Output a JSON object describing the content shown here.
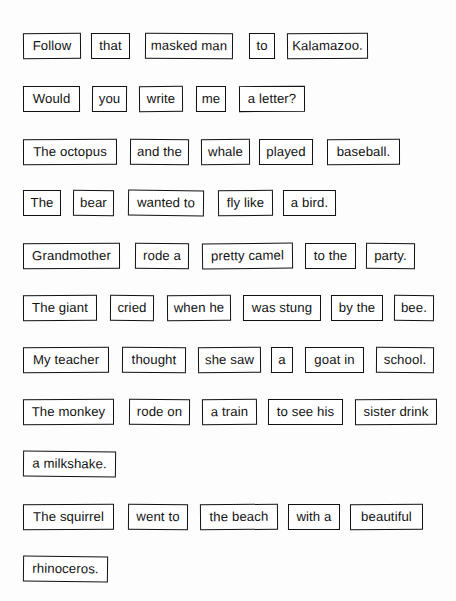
{
  "document": {
    "kind": "sentence-strip-worksheet",
    "page_background": "#fdfdfd",
    "ink_color": "#111111",
    "card_background": "#ffffff",
    "total_rows": 11,
    "total_cards": 49
  },
  "rows": [
    {
      "index": 1,
      "sentence": "Follow that masked man to Kalamazoo.",
      "top": 33,
      "cards": [
        {
          "text": "Follow",
          "left": 23,
          "width": 58,
          "skew": "sk-a"
        },
        {
          "text": "that",
          "left": 91,
          "width": 39,
          "skew": "sk-c"
        },
        {
          "text": "masked man",
          "left": 145,
          "width": 88,
          "skew": "sk-b"
        },
        {
          "text": "to",
          "left": 249,
          "width": 26,
          "skew": "sk-c"
        },
        {
          "text": "Kalamazoo.",
          "left": 287,
          "width": 81,
          "skew": "sk-a"
        }
      ]
    },
    {
      "index": 2,
      "sentence": "Would you write me a letter?",
      "top": 86,
      "cards": [
        {
          "text": "Would",
          "left": 23,
          "width": 57,
          "skew": "sk-c"
        },
        {
          "text": "you",
          "left": 92,
          "width": 35,
          "skew": "sk-b"
        },
        {
          "text": "write",
          "left": 139,
          "width": 44,
          "skew": "sk-a"
        },
        {
          "text": "me",
          "left": 196,
          "width": 30,
          "skew": "sk-f"
        },
        {
          "text": "a letter?",
          "left": 239,
          "width": 66,
          "skew": "sk-c"
        }
      ]
    },
    {
      "index": 3,
      "sentence": "The octopus and the whale played baseball.",
      "top": 139,
      "cards": [
        {
          "text": "The octopus",
          "left": 23,
          "width": 94,
          "skew": "sk-c"
        },
        {
          "text": "and the",
          "left": 130,
          "width": 59,
          "skew": "sk-b"
        },
        {
          "text": "whale",
          "left": 201,
          "width": 49,
          "skew": "sk-a"
        },
        {
          "text": "played",
          "left": 259,
          "width": 54,
          "skew": "sk-f"
        },
        {
          "text": "baseball.",
          "left": 327,
          "width": 73,
          "skew": "sk-c"
        }
      ]
    },
    {
      "index": 4,
      "sentence": "The bear wanted to fly like a bird.",
      "top": 190,
      "cards": [
        {
          "text": "The",
          "left": 23,
          "width": 38,
          "skew": "sk-c"
        },
        {
          "text": "bear",
          "left": 73,
          "width": 41,
          "skew": "sk-b"
        },
        {
          "text": "wanted to",
          "left": 128,
          "width": 76,
          "skew": "sk-d"
        },
        {
          "text": "fly like",
          "left": 218,
          "width": 55,
          "skew": "sk-a"
        },
        {
          "text": "a bird.",
          "left": 283,
          "width": 53,
          "skew": "sk-c"
        }
      ]
    },
    {
      "index": 5,
      "sentence": "Grandmother rode a pretty camel to the party.",
      "top": 243,
      "cards": [
        {
          "text": "Grandmother",
          "left": 23,
          "width": 97,
          "skew": "sk-c"
        },
        {
          "text": "rode a",
          "left": 135,
          "width": 54,
          "skew": "sk-b"
        },
        {
          "text": "pretty camel",
          "left": 202,
          "width": 91,
          "skew": "sk-e"
        },
        {
          "text": "to the",
          "left": 305,
          "width": 51,
          "skew": "sk-f"
        },
        {
          "text": "party.",
          "left": 366,
          "width": 49,
          "skew": "sk-b"
        }
      ]
    },
    {
      "index": 6,
      "sentence": "The giant cried when he was stung by the bee.",
      "top": 295,
      "cards": [
        {
          "text": "The giant",
          "left": 23,
          "width": 74,
          "skew": "sk-c"
        },
        {
          "text": "cried",
          "left": 110,
          "width": 44,
          "skew": "sk-b"
        },
        {
          "text": "when he",
          "left": 167,
          "width": 64,
          "skew": "sk-a"
        },
        {
          "text": "was stung",
          "left": 243,
          "width": 78,
          "skew": "sk-f"
        },
        {
          "text": "by the",
          "left": 331,
          "width": 52,
          "skew": "sk-c"
        },
        {
          "text": "bee.",
          "left": 394,
          "width": 40,
          "skew": "sk-b"
        }
      ]
    },
    {
      "index": 7,
      "sentence": "My teacher thought she saw a goat in school.",
      "top": 347,
      "cards": [
        {
          "text": "My teacher",
          "left": 23,
          "width": 86,
          "skew": "sk-c"
        },
        {
          "text": "thought",
          "left": 122,
          "width": 64,
          "skew": "sk-b"
        },
        {
          "text": "she saw",
          "left": 198,
          "width": 63,
          "skew": "sk-a"
        },
        {
          "text": "a",
          "left": 271,
          "width": 22,
          "skew": "sk-f"
        },
        {
          "text": "goat in",
          "left": 305,
          "width": 59,
          "skew": "sk-c"
        },
        {
          "text": "school.",
          "left": 376,
          "width": 58,
          "skew": "sk-b"
        }
      ]
    },
    {
      "index": 8,
      "sentence": "The monkey rode on a train to see his sister drink a milkshake.",
      "top": 399,
      "cards": [
        {
          "text": "The monkey",
          "left": 23,
          "width": 91,
          "skew": "sk-c"
        },
        {
          "text": "rode on",
          "left": 129,
          "width": 61,
          "skew": "sk-b"
        },
        {
          "text": "a train",
          "left": 202,
          "width": 55,
          "skew": "sk-a"
        },
        {
          "text": "to see his",
          "left": 268,
          "width": 75,
          "skew": "sk-f"
        },
        {
          "text": "sister drink",
          "left": 355,
          "width": 82,
          "skew": "sk-c"
        }
      ]
    },
    {
      "index": 9,
      "sentence": "a milkshake.",
      "top": 451,
      "cards": [
        {
          "text": "a milkshake.",
          "left": 23,
          "width": 93,
          "skew": "sk-d"
        }
      ]
    },
    {
      "index": 10,
      "sentence": "The squirrel went to the beach with a beautiful rhinoceros.",
      "top": 504,
      "cards": [
        {
          "text": "The squirrel",
          "left": 23,
          "width": 91,
          "skew": "sk-c"
        },
        {
          "text": "went to",
          "left": 128,
          "width": 60,
          "skew": "sk-b"
        },
        {
          "text": "the beach",
          "left": 200,
          "width": 78,
          "skew": "sk-a"
        },
        {
          "text": "with a",
          "left": 288,
          "width": 52,
          "skew": "sk-f"
        },
        {
          "text": "beautiful",
          "left": 350,
          "width": 73,
          "skew": "sk-c"
        }
      ]
    },
    {
      "index": 11,
      "sentence": "rhinoceros.",
      "top": 556,
      "cards": [
        {
          "text": "rhinoceros.",
          "left": 23,
          "width": 85,
          "skew": "sk-d"
        }
      ]
    }
  ]
}
